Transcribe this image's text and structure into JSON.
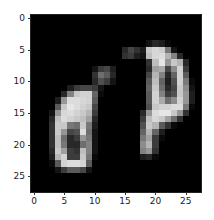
{
  "chart_data": {
    "type": "heatmap",
    "title": "",
    "xlabel": "",
    "ylabel": "",
    "colormap": "gray",
    "shape": [
      28,
      28
    ],
    "xticks": [
      0,
      5,
      10,
      15,
      20,
      25
    ],
    "yticks": [
      0,
      5,
      10,
      15,
      20,
      25
    ],
    "xlim": [
      -0.5,
      27.5
    ],
    "ylim": [
      27.5,
      -0.5
    ],
    "grid": false,
    "values": [
      [
        0,
        0,
        0,
        0,
        0,
        0,
        0,
        0,
        0,
        0,
        0,
        0,
        0,
        0,
        0,
        0,
        0,
        0,
        0,
        0,
        0,
        0,
        0,
        0,
        0,
        0,
        0,
        0
      ],
      [
        0,
        0,
        0,
        0,
        0,
        0,
        0,
        0,
        0,
        0,
        0,
        0,
        0,
        0,
        0,
        0,
        0,
        0,
        0,
        0,
        0,
        0,
        0,
        0,
        0,
        0,
        0,
        0
      ],
      [
        0,
        0,
        0,
        0,
        0,
        0,
        0,
        0,
        0,
        0,
        0,
        0,
        0,
        0,
        0,
        0,
        0,
        0,
        0,
        0,
        0,
        0,
        0,
        0,
        0,
        0,
        0,
        0
      ],
      [
        0,
        0,
        0,
        0,
        0,
        0,
        0,
        0,
        0,
        0,
        0,
        0,
        0,
        0,
        0,
        0,
        0,
        0,
        0,
        0,
        0,
        0,
        0,
        0,
        0,
        0,
        0,
        0
      ],
      [
        0,
        0,
        0,
        0,
        0,
        0,
        0,
        0,
        0,
        0,
        0,
        0,
        0,
        0,
        0,
        0,
        0,
        0,
        0,
        20,
        40,
        30,
        10,
        0,
        0,
        0,
        0,
        0
      ],
      [
        0,
        0,
        0,
        0,
        0,
        0,
        0,
        0,
        0,
        0,
        0,
        0,
        0,
        0,
        0,
        40,
        70,
        50,
        30,
        200,
        215,
        205,
        120,
        20,
        0,
        0,
        0,
        0
      ],
      [
        0,
        0,
        0,
        0,
        0,
        0,
        0,
        0,
        0,
        0,
        0,
        0,
        0,
        0,
        0,
        50,
        60,
        30,
        20,
        190,
        215,
        220,
        180,
        130,
        40,
        0,
        0,
        0
      ],
      [
        0,
        0,
        0,
        0,
        0,
        0,
        0,
        0,
        0,
        0,
        0,
        0,
        0,
        0,
        0,
        0,
        0,
        0,
        0,
        50,
        190,
        230,
        150,
        200,
        180,
        40,
        0,
        0
      ],
      [
        0,
        0,
        0,
        0,
        0,
        0,
        0,
        0,
        0,
        0,
        20,
        60,
        70,
        30,
        0,
        0,
        0,
        0,
        0,
        40,
        160,
        170,
        70,
        140,
        210,
        60,
        0,
        0
      ],
      [
        0,
        0,
        0,
        0,
        0,
        0,
        0,
        0,
        0,
        0,
        50,
        110,
        90,
        40,
        0,
        0,
        0,
        0,
        0,
        70,
        180,
        130,
        40,
        100,
        210,
        90,
        0,
        0
      ],
      [
        0,
        0,
        0,
        0,
        0,
        0,
        0,
        0,
        0,
        0,
        40,
        80,
        60,
        20,
        0,
        0,
        0,
        0,
        0,
        90,
        190,
        100,
        30,
        80,
        210,
        120,
        10,
        0
      ],
      [
        0,
        0,
        0,
        0,
        0,
        0,
        30,
        60,
        70,
        70,
        60,
        20,
        0,
        0,
        0,
        0,
        0,
        0,
        0,
        100,
        200,
        110,
        40,
        70,
        200,
        140,
        20,
        0
      ],
      [
        0,
        0,
        0,
        0,
        0,
        40,
        130,
        200,
        210,
        210,
        100,
        10,
        0,
        0,
        0,
        0,
        0,
        0,
        0,
        90,
        210,
        130,
        60,
        80,
        200,
        150,
        30,
        0
      ],
      [
        0,
        0,
        0,
        0,
        30,
        150,
        220,
        220,
        215,
        210,
        90,
        0,
        0,
        0,
        0,
        0,
        0,
        0,
        0,
        90,
        210,
        170,
        110,
        140,
        210,
        150,
        30,
        0
      ],
      [
        0,
        0,
        0,
        0,
        90,
        200,
        230,
        220,
        210,
        200,
        70,
        0,
        0,
        0,
        0,
        0,
        0,
        0,
        0,
        80,
        200,
        210,
        210,
        220,
        220,
        120,
        10,
        0
      ],
      [
        0,
        0,
        0,
        20,
        150,
        215,
        220,
        210,
        200,
        180,
        60,
        0,
        0,
        0,
        0,
        0,
        0,
        0,
        40,
        150,
        220,
        230,
        230,
        200,
        150,
        50,
        0,
        0
      ],
      [
        0,
        0,
        0,
        40,
        190,
        220,
        210,
        200,
        190,
        160,
        40,
        0,
        0,
        0,
        0,
        0,
        0,
        0,
        60,
        190,
        215,
        200,
        160,
        110,
        50,
        0,
        0,
        0
      ],
      [
        0,
        0,
        0,
        50,
        200,
        200,
        120,
        110,
        200,
        120,
        30,
        0,
        0,
        0,
        0,
        0,
        0,
        0,
        80,
        200,
        180,
        90,
        50,
        10,
        0,
        0,
        0,
        0
      ],
      [
        0,
        0,
        0,
        50,
        200,
        150,
        70,
        80,
        220,
        110,
        20,
        0,
        0,
        0,
        0,
        0,
        0,
        0,
        100,
        180,
        100,
        30,
        0,
        0,
        0,
        0,
        0,
        0
      ],
      [
        0,
        0,
        0,
        50,
        190,
        110,
        40,
        60,
        150,
        120,
        20,
        0,
        0,
        0,
        0,
        0,
        0,
        0,
        120,
        160,
        60,
        10,
        0,
        0,
        0,
        0,
        0,
        0
      ],
      [
        0,
        0,
        0,
        50,
        190,
        120,
        40,
        40,
        110,
        130,
        20,
        0,
        0,
        0,
        0,
        0,
        0,
        0,
        140,
        180,
        60,
        0,
        0,
        0,
        0,
        0,
        0,
        0
      ],
      [
        0,
        0,
        0,
        40,
        200,
        160,
        60,
        50,
        190,
        130,
        20,
        0,
        0,
        0,
        0,
        0,
        0,
        0,
        130,
        150,
        50,
        0,
        0,
        0,
        0,
        0,
        0,
        0
      ],
      [
        0,
        0,
        0,
        30,
        180,
        210,
        60,
        60,
        200,
        120,
        10,
        0,
        0,
        0,
        0,
        0,
        0,
        0,
        30,
        40,
        10,
        0,
        0,
        0,
        0,
        0,
        0,
        0
      ],
      [
        0,
        0,
        0,
        10,
        90,
        210,
        220,
        220,
        210,
        90,
        0,
        0,
        0,
        0,
        0,
        0,
        0,
        0,
        0,
        0,
        0,
        0,
        0,
        0,
        0,
        0,
        0,
        0
      ],
      [
        0,
        0,
        0,
        0,
        20,
        60,
        90,
        90,
        70,
        20,
        0,
        0,
        0,
        0,
        0,
        0,
        0,
        0,
        0,
        0,
        0,
        0,
        0,
        0,
        0,
        0,
        0,
        0
      ],
      [
        0,
        0,
        0,
        0,
        0,
        0,
        0,
        0,
        0,
        0,
        0,
        0,
        0,
        0,
        0,
        0,
        0,
        0,
        0,
        0,
        0,
        0,
        0,
        0,
        0,
        0,
        0,
        0
      ],
      [
        0,
        0,
        0,
        0,
        0,
        0,
        0,
        0,
        0,
        0,
        0,
        0,
        0,
        0,
        0,
        0,
        0,
        0,
        0,
        0,
        0,
        0,
        0,
        0,
        0,
        0,
        0,
        0
      ],
      [
        0,
        0,
        0,
        0,
        0,
        0,
        0,
        0,
        0,
        0,
        0,
        0,
        0,
        0,
        0,
        0,
        0,
        0,
        0,
        0,
        0,
        0,
        0,
        0,
        0,
        0,
        0,
        0
      ]
    ]
  },
  "axes": {
    "x_tick_labels": [
      "0",
      "5",
      "10",
      "15",
      "20",
      "25"
    ],
    "y_tick_labels": [
      "0",
      "5",
      "10",
      "15",
      "20",
      "25"
    ]
  }
}
